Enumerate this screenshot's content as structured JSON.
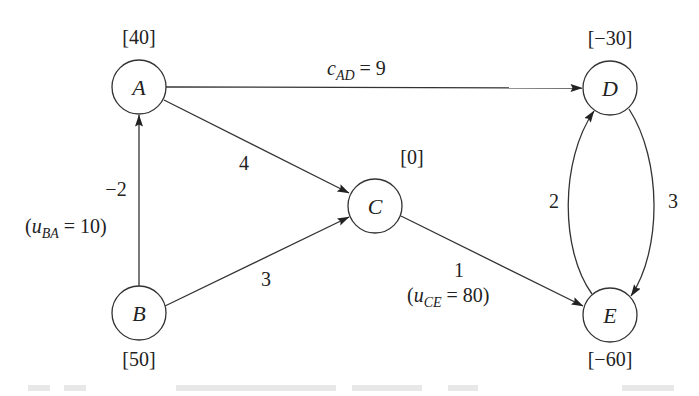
{
  "diagram": {
    "type": "network-flow",
    "nodes": [
      {
        "id": "A",
        "label": "A",
        "supply": "[40]",
        "cx": 139,
        "cy": 87
      },
      {
        "id": "B",
        "label": "B",
        "supply": "[50]",
        "cx": 139,
        "cy": 313
      },
      {
        "id": "C",
        "label": "C",
        "supply": "[0]",
        "cx": 375,
        "cy": 206
      },
      {
        "id": "D",
        "label": "D",
        "supply": "[−30]",
        "cx": 610,
        "cy": 88
      },
      {
        "id": "E",
        "label": "E",
        "supply": "[−60]",
        "cx": 610,
        "cy": 315
      }
    ],
    "edges": [
      {
        "from": "A",
        "to": "D",
        "cost": "9",
        "label_var": "c",
        "label_sub": "AD",
        "label_rest": " = 9"
      },
      {
        "from": "A",
        "to": "C",
        "cost": "4"
      },
      {
        "from": "B",
        "to": "A",
        "cost": "−2",
        "capacity_var": "u",
        "capacity_sub": "BA",
        "capacity_rest": " = 10)"
      },
      {
        "from": "B",
        "to": "C",
        "cost": "3"
      },
      {
        "from": "C",
        "to": "E",
        "cost": "1",
        "capacity_var": "u",
        "capacity_sub": "CE",
        "capacity_rest": " = 80)"
      },
      {
        "from": "E",
        "to": "D",
        "cost": "2"
      },
      {
        "from": "D",
        "to": "E",
        "cost": "3"
      }
    ],
    "colors": {
      "stroke": "#333333",
      "text": "#222222",
      "background": "#ffffff"
    }
  }
}
